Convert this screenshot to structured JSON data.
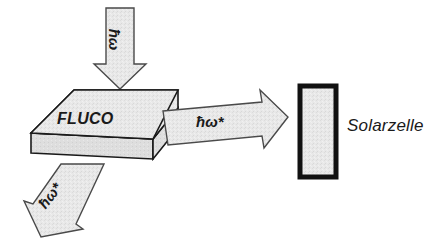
{
  "diagram": {
    "background_color": "#ffffff",
    "shape_fill_color": "#e8e8e8",
    "shape_stroke_color": "#1a1a1a",
    "text_color": "#1a1a1a"
  },
  "slab": {
    "label": "FLUCO",
    "description": "Flache Platte in 3D-Perspektive"
  },
  "solar_cell": {
    "label": "Solarzelle",
    "description": "Aufrecht stehendes Rechteck mit dicker schwarzer Umrandung"
  },
  "arrows": {
    "incoming": {
      "label": "ħω",
      "direction": "down",
      "name": "incident-photon-arrow"
    },
    "emitted_right": {
      "label": "ħω*",
      "direction": "right",
      "name": "emitted-photon-arrow-right"
    },
    "emitted_down_left": {
      "label": "ħω*",
      "direction": "down-left",
      "name": "emitted-photon-arrow-down-left"
    }
  }
}
